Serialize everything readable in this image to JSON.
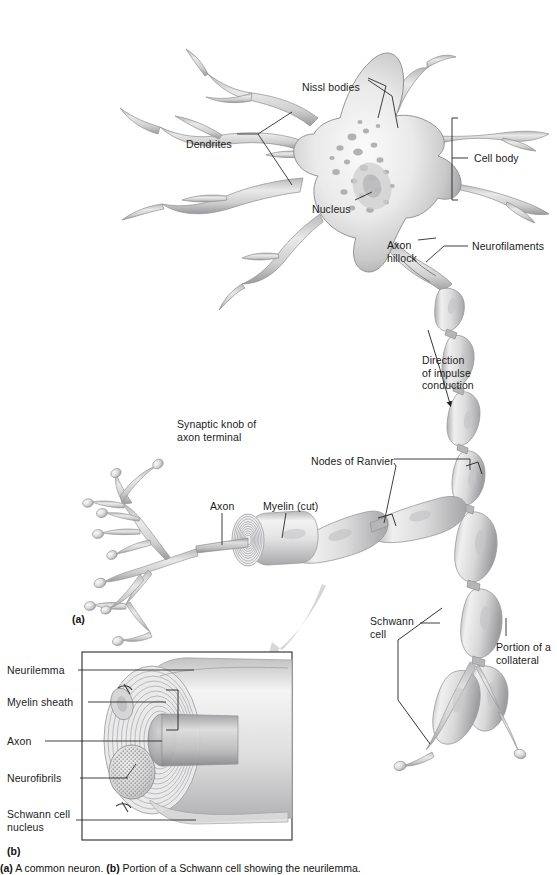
{
  "figure": {
    "panel_a_marker": "(a)",
    "panel_b_marker": "(b)",
    "caption": "(a) A common neuron. (b) Portion of a Schwann cell showing the neurilemma.",
    "caption_lead": "(a)",
    "caption_rest_1": " A common neuron. ",
    "caption_b": "(b)",
    "caption_rest_2": " Portion of a Schwann cell showing the neurilemma."
  },
  "colors": {
    "ink": "#1b1b1b",
    "leader": "#1f1f1f",
    "membrane_dark": "#8d8d8f",
    "membrane_mid": "#bdbdbe",
    "cytoplasm_light": "#f2f2f2",
    "nissl": "#a9a9ab",
    "myelin": "#d8d8d9",
    "arrow_gray": "#cfcfd0",
    "background": "#ffffff"
  },
  "panel_a": {
    "labels": [
      {
        "id": "nissl-bodies",
        "text": "Nissl bodies",
        "x": 302,
        "y": 81,
        "align": "left"
      },
      {
        "id": "dendrites",
        "text": "Dendrites",
        "x": 186,
        "y": 138,
        "align": "left"
      },
      {
        "id": "cell-body",
        "text": "Cell body",
        "x": 474,
        "y": 156,
        "align": "left"
      },
      {
        "id": "nucleus",
        "text": "Nucleus",
        "x": 312,
        "y": 203,
        "align": "left"
      },
      {
        "id": "axon-hillock",
        "text": "Axon\nhillock",
        "x": 387,
        "y": 243,
        "align": "left"
      },
      {
        "id": "neurofilaments",
        "text": "Neurofilaments",
        "x": 472,
        "y": 243,
        "align": "left"
      },
      {
        "id": "impulse",
        "text": "Direction\nof impulse\nconduction",
        "x": 422,
        "y": 360,
        "align": "left"
      },
      {
        "id": "synaptic-knob",
        "text": "Synaptic knob of\naxon terminal",
        "x": 177,
        "y": 421,
        "align": "left"
      },
      {
        "id": "nodes-ranvier",
        "text": "Nodes of Ranvier",
        "x": 311,
        "y": 460,
        "align": "left"
      },
      {
        "id": "axon",
        "text": "Axon",
        "x": 212,
        "y": 505,
        "align": "left"
      },
      {
        "id": "myelin-cut",
        "text": "Myelin (cut)",
        "x": 266,
        "y": 505,
        "align": "left"
      },
      {
        "id": "schwann-cell",
        "text": "Schwann\ncell",
        "x": 370,
        "y": 618,
        "align": "left"
      },
      {
        "id": "collateral",
        "text": "Portion of a\ncollateral",
        "x": 498,
        "y": 644,
        "align": "left"
      }
    ]
  },
  "panel_b": {
    "labels": [
      {
        "id": "neurilemma",
        "text": "Neurilemma",
        "x": 7,
        "y": 668
      },
      {
        "id": "myelin-sheath",
        "text": "Myelin sheath",
        "x": 7,
        "y": 700
      },
      {
        "id": "axon-inset",
        "text": "Axon",
        "x": 7,
        "y": 739
      },
      {
        "id": "neurofibrils",
        "text": "Neurofibrils",
        "x": 7,
        "y": 776
      },
      {
        "id": "schwann-cell-nucleus",
        "text": "Schwann cell\nnucleus",
        "x": 7,
        "y": 818
      }
    ],
    "box": {
      "x": 82,
      "y": 652,
      "w": 210,
      "h": 188
    }
  }
}
